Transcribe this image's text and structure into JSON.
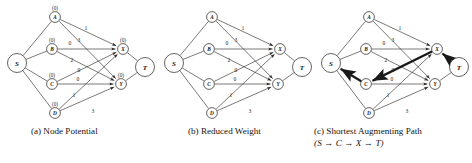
{
  "figure": {
    "type": "graph-diagram-triptych",
    "background": "#ffffff",
    "ink_color": "#2b2724",
    "highlight_color": "#1a1a1a"
  },
  "nodes": {
    "S": {
      "label": "S",
      "x": 17,
      "y": 63,
      "r": 9.5,
      "potential": null
    },
    "A": {
      "label": "A",
      "x": 55,
      "y": 17,
      "r": 5.4,
      "potential": "(0)"
    },
    "B": {
      "label": "B",
      "x": 52,
      "y": 49,
      "r": 5.4,
      "potential": "(0)"
    },
    "C": {
      "label": "C",
      "x": 52,
      "y": 84,
      "r": 5.4,
      "potential": "(0)"
    },
    "D": {
      "label": "D",
      "x": 55,
      "y": 113,
      "r": 5.4,
      "potential": "(0)"
    },
    "X": {
      "label": "X",
      "x": 123,
      "y": 49,
      "r": 5.4,
      "potential": "(0)"
    },
    "Y": {
      "label": "Y",
      "x": 121,
      "y": 84,
      "r": 5.4,
      "potential": "(0)"
    },
    "T": {
      "label": "T",
      "x": 145,
      "y": 67,
      "r": 9.5,
      "potential": null
    }
  },
  "source_sink_edges": [
    {
      "from": "S",
      "to": "A"
    },
    {
      "from": "S",
      "to": "B"
    },
    {
      "from": "S",
      "to": "C"
    },
    {
      "from": "S",
      "to": "D"
    },
    {
      "from": "X",
      "to": "T"
    },
    {
      "from": "Y",
      "to": "T"
    }
  ],
  "weighted_edges": [
    {
      "from": "A",
      "to": "X",
      "weight": "1",
      "label_x": 86,
      "label_y": 30
    },
    {
      "from": "A",
      "to": "Y",
      "weight": "3",
      "label_x": 79,
      "label_y": 42
    },
    {
      "from": "B",
      "to": "X",
      "weight": "0",
      "label_x": 70,
      "label_y": 45
    },
    {
      "from": "B",
      "to": "Y",
      "weight": "2",
      "label_x": 72,
      "label_y": 62
    },
    {
      "from": "C",
      "to": "X",
      "weight": "0",
      "label_x": 79,
      "label_y": 72
    },
    {
      "from": "C",
      "to": "Y",
      "weight": "0",
      "label_x": 78,
      "label_y": 81
    },
    {
      "from": "D",
      "to": "X",
      "weight": "1",
      "label_x": 74,
      "label_y": 97
    },
    {
      "from": "D",
      "to": "Y",
      "weight": "3",
      "label_x": 93,
      "label_y": 113
    }
  ],
  "panels": [
    {
      "id": "a",
      "caption": "(a)  Node Potential",
      "caption_line2": null,
      "show_potentials": true,
      "highlight_path": []
    },
    {
      "id": "b",
      "caption": "(b)  Reduced Weight",
      "caption_line2": null,
      "show_potentials": false,
      "highlight_path": []
    },
    {
      "id": "c",
      "caption": "(c)  Shortest  Augmenting  Path",
      "caption_line2": "(S → C → X → T)",
      "show_potentials": false,
      "highlight_path": [
        "T",
        "X",
        "C",
        "S"
      ]
    }
  ],
  "chart_data": {
    "type": "diagram",
    "left_nodes": [
      "A",
      "B",
      "C",
      "D"
    ],
    "right_nodes": [
      "X",
      "Y"
    ],
    "source": "S",
    "sink": "T",
    "edge_weights": {
      "A-X": 1,
      "A-Y": 3,
      "B-X": 0,
      "B-Y": 2,
      "C-X": 0,
      "C-Y": 0,
      "D-X": 1,
      "D-Y": 3
    },
    "node_potentials": {
      "A": 0,
      "B": 0,
      "C": 0,
      "D": 0,
      "X": 0,
      "Y": 0
    },
    "augmenting_path": [
      "S",
      "C",
      "X",
      "T"
    ]
  }
}
